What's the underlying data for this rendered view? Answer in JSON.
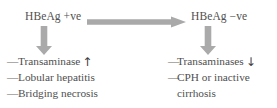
{
  "diagram": {
    "type": "clinical-flow-diagram",
    "colors": {
      "background": "#ffffff",
      "text": "#4f4f4f",
      "arrow": "#a8a8a8"
    },
    "nodes": {
      "left": "HBeAg +ve",
      "right": "HBeAg −ve"
    },
    "arrows": {
      "horizontal": "arrow-right",
      "left_vertical": "arrow-down",
      "right_vertical": "arrow-down"
    },
    "left_column": {
      "bullet": "—",
      "items": [
        {
          "text": "Transaminase",
          "trend": "↑"
        },
        {
          "text": "Lobular hepatitis",
          "trend": ""
        },
        {
          "text": "Bridging necrosis",
          "trend": ""
        }
      ]
    },
    "right_column": {
      "bullet": "—",
      "items": [
        {
          "text": "Transaminases",
          "trend": "↓"
        },
        {
          "text": "CPH or inactive",
          "text2": "cirrhosis",
          "trend": ""
        }
      ]
    }
  }
}
